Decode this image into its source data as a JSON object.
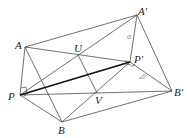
{
  "diagram": {
    "type": "geometry",
    "points": {
      "A": {
        "label": "A",
        "x": 25,
        "y": 47
      },
      "A'": {
        "label": "A′",
        "x": 137,
        "y": 15
      },
      "U": {
        "label": "U",
        "x": 78,
        "y": 55
      },
      "P'": {
        "label": "P′",
        "x": 130,
        "y": 62
      },
      "P": {
        "label": "P",
        "x": 20,
        "y": 95
      },
      "V": {
        "label": "V",
        "x": 97,
        "y": 93
      },
      "B'": {
        "label": "B′",
        "x": 172,
        "y": 91
      },
      "B": {
        "label": "B",
        "x": 62,
        "y": 122
      }
    },
    "angle_labels": {
      "alpha": "α",
      "beta": "β"
    },
    "edges": [
      [
        "A",
        "A'"
      ],
      [
        "A",
        "P"
      ],
      [
        "A",
        "B"
      ],
      [
        "A",
        "P'"
      ],
      [
        "A'",
        "P'"
      ],
      [
        "A'",
        "B'"
      ],
      [
        "P",
        "A'"
      ],
      [
        "P",
        "P'"
      ],
      [
        "P",
        "B'"
      ],
      [
        "P",
        "B"
      ],
      [
        "U",
        "V"
      ],
      [
        "B",
        "P'"
      ],
      [
        "P'",
        "B'"
      ],
      [
        "B",
        "B'"
      ]
    ],
    "bold_edge": [
      "P",
      "P'"
    ],
    "right_angles": [
      "P",
      "P'"
    ],
    "colors": {
      "line": "#333333",
      "bold": "#111111",
      "label": "#222222",
      "greek": "#888888"
    }
  }
}
